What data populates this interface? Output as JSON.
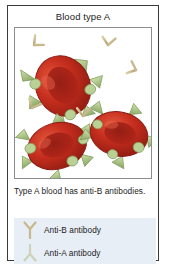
{
  "card": {
    "title": "Blood type A",
    "caption": "Type A blood has anti-B antibodies."
  },
  "figure": {
    "name": "blood-type-a-illustration",
    "cell_color": "#c0281d",
    "cell_dark": "#8d1a12",
    "cell_highlight": "#e0523a",
    "antigen_color": "#b5cf8e",
    "antigen_edge": "#7f9a5c",
    "antibody_color": "#c9b храм"
  },
  "colors": {
    "card_border": "#3a3a3a",
    "panel_border": "#8c8c8c",
    "legend_background": "#e8eef6",
    "antibody_b": "#c8b98d",
    "antibody_a": "#e2e6d2",
    "text": "#1c1c1c"
  },
  "legend": {
    "items": [
      {
        "icon": "antibody-b-icon",
        "label": "Anti-B antibody"
      },
      {
        "icon": "antibody-a-icon",
        "label": "Anti-A antibody"
      }
    ]
  }
}
